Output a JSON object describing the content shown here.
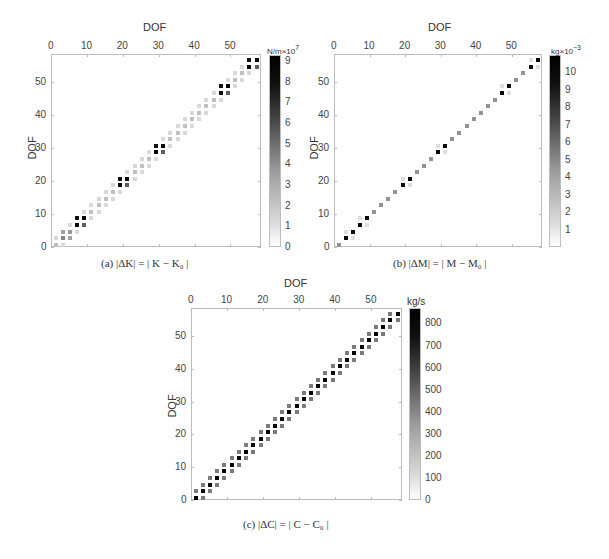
{
  "chart_data": [
    {
      "id": "a",
      "type": "heatmap",
      "title": "",
      "caption": "(a) |ΔK| = | K − K₀ |",
      "xlabel": "DOF",
      "ylabel": "DOF",
      "x_ticks": [
        0,
        10,
        20,
        30,
        40,
        50
      ],
      "y_ticks": [
        0,
        10,
        20,
        30,
        40,
        50
      ],
      "xlim": [
        0,
        58.5
      ],
      "ylim": [
        0,
        58.5
      ],
      "grid": false,
      "colorbar": {
        "unit": "N/m",
        "multiplier": "×10",
        "exponent": "7",
        "ticks": [
          0,
          1,
          2,
          3,
          4,
          5,
          6,
          7,
          8,
          9
        ],
        "range": [
          0,
          9.3
        ]
      },
      "description": "Banded sparse matrix; 2x2 dark blocks (~9e7) at DOF pairs (7,9),(19,21),(29,31),(47,49),(55,57); medium (~3-4e7) block at (3,5); light grey (~1-3e7) entries along diagonal band elsewhere",
      "strong_blocks": [
        [
          7,
          9
        ],
        [
          19,
          21
        ],
        [
          29,
          31
        ],
        [
          47,
          49
        ],
        [
          55,
          57
        ]
      ],
      "medium_blocks": [
        [
          3,
          5
        ]
      ],
      "strong_value": 9.0,
      "medium_value": 4.0,
      "diag_value": 3.0,
      "offdiag_value": 1.0
    },
    {
      "id": "b",
      "type": "heatmap",
      "title": "",
      "caption": "(b) |ΔM| = | M − M₀ |",
      "xlabel": "DOF",
      "ylabel": "DOF",
      "x_ticks": [
        0,
        10,
        20,
        30,
        40,
        50
      ],
      "y_ticks": [
        0,
        10,
        20,
        30,
        40,
        50
      ],
      "xlim": [
        0,
        58.5
      ],
      "ylim": [
        0,
        58.5
      ],
      "grid": false,
      "colorbar": {
        "unit": "kg",
        "multiplier": "×10",
        "exponent": "−3",
        "ticks": [
          1,
          2,
          3,
          4,
          5,
          6,
          7,
          8,
          9,
          10
        ],
        "range": [
          0,
          11
        ]
      },
      "description": "Diagonal entries at odd DOFs; dark (~10e-3) at DOFs 3,5,7,9,19,21,29,31,47,49,55,57; grey (~4e-3) at other odd DOFs; faint off-diagonals next to dark pairs",
      "strong_diag": [
        3,
        5,
        7,
        9,
        19,
        21,
        29,
        31,
        47,
        49,
        55,
        57
      ],
      "strong_value": 10.5,
      "diag_value": 4.0,
      "offdiag_value": 1.0
    },
    {
      "id": "c",
      "type": "heatmap",
      "title": "",
      "caption": "(c) |ΔC| = | C − C₀ |",
      "xlabel": "DOF",
      "ylabel": "DOF",
      "x_ticks": [
        0,
        10,
        20,
        30,
        40,
        50
      ],
      "y_ticks": [
        0,
        10,
        20,
        30,
        40,
        50
      ],
      "xlim": [
        0,
        58.5
      ],
      "ylim": [
        0,
        58.5
      ],
      "grid": false,
      "colorbar": {
        "unit": "kg/s",
        "multiplier": "",
        "exponent": "",
        "ticks": [
          0,
          100,
          200,
          300,
          400,
          500,
          600,
          700,
          800
        ],
        "range": [
          0,
          870
        ]
      },
      "description": "Tridiagonal (stride 2) band at odd DOFs: dark diagonal (~870 kg/s) at each odd DOF 1..57, grey (~400 kg/s) neighbors at ±2",
      "diag_value": 870,
      "offdiag_value": 400
    }
  ]
}
